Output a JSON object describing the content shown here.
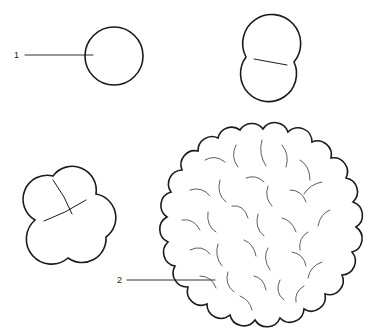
{
  "diagram": {
    "type": "cleavage-stages",
    "labels": [
      {
        "id": "1",
        "text": "1",
        "target": "single-cell"
      },
      {
        "id": "2",
        "text": "2",
        "target": "morula-cell"
      }
    ],
    "stages": [
      "single-cell",
      "two-cell",
      "four-cell",
      "morula"
    ],
    "stroke_color": "#1a1a1a",
    "background": "#ffffff"
  }
}
